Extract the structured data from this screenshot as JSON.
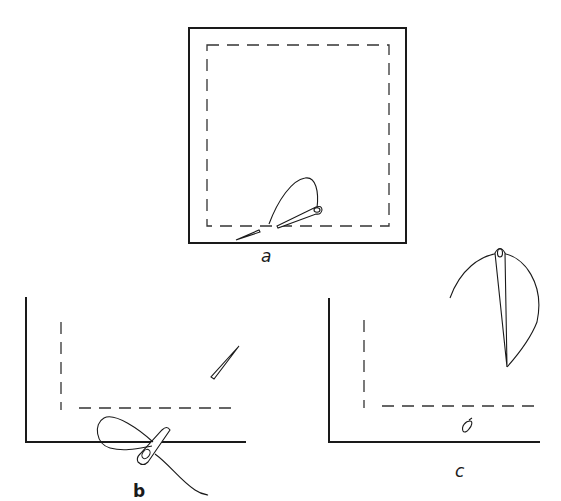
{
  "figure": {
    "panels": [
      {
        "id": "a",
        "label": "a",
        "content": "square fabric with dashed stitching line inside border; needle with thread loop near bottom edge"
      },
      {
        "id": "b",
        "label": "b",
        "content": "corner of fabric with dashed line; needle passing through fold with thread loop; separate needle tip above"
      },
      {
        "id": "c",
        "label": "c",
        "content": "corner of fabric with dashed line; needle held vertically with thread arc; small knot near edge"
      }
    ]
  },
  "colors": {
    "ink": "#1a1a1a",
    "background": "#ffffff"
  }
}
